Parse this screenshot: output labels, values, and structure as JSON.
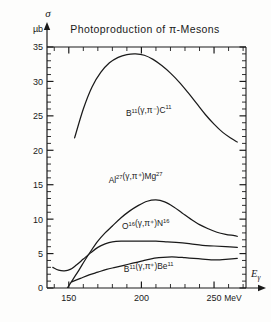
{
  "figure": {
    "title": "Photoproduction of π-Mesons",
    "y_axis_symbol": "σ",
    "y_axis_unit": "µb",
    "x_axis_label": "E",
    "x_axis_label_sub": "γ",
    "x_axis_unit": "MeV"
  },
  "axes": {
    "y_ticks_major": [
      "0",
      "5",
      "10",
      "15",
      "20",
      "25",
      "30",
      "35"
    ],
    "x_ticks_major": [
      "150",
      "200",
      "250"
    ]
  },
  "chart_data": {
    "type": "line",
    "title": "Photoproduction of π-Mesons",
    "xlabel": "Eγ (MeV)",
    "ylabel": "σ (µb)",
    "xlim": [
      135,
      272
    ],
    "ylim": [
      0,
      35
    ],
    "xticks": [
      150,
      200,
      250
    ],
    "xticks_minor_step": 10,
    "yticks": [
      0,
      5,
      10,
      15,
      20,
      25,
      30,
      35
    ],
    "yticks_minor_step": 1,
    "grid": false,
    "legend": "inline-labels",
    "series": [
      {
        "name": "B11_gamma_piminus_C11",
        "label": "B¹¹(γ,π⁻)C¹¹",
        "label_text_parts": {
          "base1": "B",
          "sup1": "11",
          "mid": "(γ,π⁻)",
          "base2": "C",
          "sup2": "11"
        },
        "points": [
          [
            154,
            21.8
          ],
          [
            160,
            26.0
          ],
          [
            166,
            29.2
          ],
          [
            172,
            31.3
          ],
          [
            178,
            32.7
          ],
          [
            184,
            33.5
          ],
          [
            190,
            33.9
          ],
          [
            196,
            34.0
          ],
          [
            202,
            33.8
          ],
          [
            208,
            33.2
          ],
          [
            214,
            32.3
          ],
          [
            220,
            31.2
          ],
          [
            226,
            29.9
          ],
          [
            232,
            28.4
          ],
          [
            238,
            26.8
          ],
          [
            244,
            25.2
          ],
          [
            250,
            23.8
          ],
          [
            256,
            22.6
          ],
          [
            262,
            21.7
          ],
          [
            266,
            21.2
          ]
        ]
      },
      {
        "name": "Al27_gamma_piplus_Mg27",
        "label": "Al²⁷(γ,π⁺)Mg²⁷",
        "label_text_parts": {
          "base1": "Al",
          "sup1": "27",
          "mid": "(γ,π⁺)",
          "base2": "Mg",
          "sup2": "27"
        },
        "points": [
          [
            149,
            0.0
          ],
          [
            153,
            1.3
          ],
          [
            157,
            2.6
          ],
          [
            161,
            4.0
          ],
          [
            165,
            5.3
          ],
          [
            170,
            6.8
          ],
          [
            175,
            8.0
          ],
          [
            180,
            9.0
          ],
          [
            186,
            10.2
          ],
          [
            192,
            11.2
          ],
          [
            198,
            12.0
          ],
          [
            204,
            12.6
          ],
          [
            210,
            12.8
          ],
          [
            216,
            12.5
          ],
          [
            222,
            11.8
          ],
          [
            228,
            10.9
          ],
          [
            234,
            10.0
          ],
          [
            240,
            9.2
          ],
          [
            246,
            8.6
          ],
          [
            252,
            8.1
          ],
          [
            258,
            7.8
          ],
          [
            264,
            7.6
          ],
          [
            266,
            7.5
          ]
        ]
      },
      {
        "name": "O16_gamma_piplus_N16",
        "label": "O¹⁶(γ,π⁺)N¹⁶",
        "label_text_parts": {
          "base1": "O",
          "sup1": "16",
          "mid": "(γ,π⁺)",
          "base2": "N",
          "sup2": "16"
        },
        "points": [
          [
            139,
            3.0
          ],
          [
            143,
            2.6
          ],
          [
            147,
            2.5
          ],
          [
            151,
            2.7
          ],
          [
            155,
            3.3
          ],
          [
            160,
            4.2
          ],
          [
            165,
            5.1
          ],
          [
            170,
            5.9
          ],
          [
            175,
            6.4
          ],
          [
            180,
            6.7
          ],
          [
            186,
            6.8
          ],
          [
            194,
            6.8
          ],
          [
            202,
            6.8
          ],
          [
            210,
            6.8
          ],
          [
            218,
            6.7
          ],
          [
            226,
            6.6
          ],
          [
            234,
            6.4
          ],
          [
            242,
            6.2
          ],
          [
            250,
            6.1
          ],
          [
            258,
            6.0
          ],
          [
            266,
            5.9
          ]
        ]
      },
      {
        "name": "B11_gamma_piplus_Be11",
        "label": "B¹¹(γ,π⁺)Be¹¹",
        "label_text_parts": {
          "base1": "B",
          "sup1": "11",
          "mid": "(γ,π⁺)",
          "base2": "Be",
          "sup2": "11"
        },
        "points": [
          [
            152,
            0.9
          ],
          [
            158,
            1.4
          ],
          [
            164,
            1.9
          ],
          [
            170,
            2.3
          ],
          [
            176,
            2.7
          ],
          [
            182,
            3.0
          ],
          [
            188,
            3.3
          ],
          [
            194,
            3.6
          ],
          [
            200,
            3.9
          ],
          [
            206,
            4.2
          ],
          [
            212,
            4.4
          ],
          [
            218,
            4.5
          ],
          [
            224,
            4.5
          ],
          [
            230,
            4.4
          ],
          [
            236,
            4.3
          ],
          [
            242,
            4.2
          ],
          [
            248,
            4.1
          ],
          [
            254,
            4.1
          ],
          [
            260,
            4.2
          ],
          [
            266,
            4.3
          ]
        ]
      }
    ],
    "annotations": [
      {
        "name": "label-b11-piminus-c11",
        "x": 205,
        "y": 25.0
      },
      {
        "name": "label-al27-piplus-mg27",
        "x": 196,
        "y": 15.3
      },
      {
        "name": "label-o16-piplus-n16",
        "x": 203,
        "y": 8.5
      },
      {
        "name": "label-b11-piplus-be11",
        "x": 205,
        "y": 2.3
      }
    ]
  },
  "colors": {
    "ink": "#1a1a1a",
    "paper": "#fdfdfc"
  }
}
